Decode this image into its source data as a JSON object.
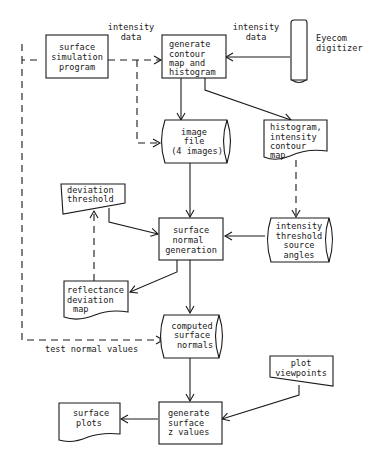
{
  "diagram": {
    "type": "flowchart",
    "nodes": {
      "surface_simulation_program": {
        "shape": "process",
        "lines": [
          "surface",
          "simulation",
          "program"
        ]
      },
      "generate_contour_map": {
        "shape": "process",
        "lines": [
          "generate",
          "contour",
          "map and",
          "histogram"
        ]
      },
      "eyecom_digitizer": {
        "shape": "device",
        "lines": [
          "Eyecom",
          "digitizer"
        ]
      },
      "image_file": {
        "shape": "storage",
        "lines": [
          "image",
          "file",
          "(4 images)"
        ]
      },
      "histogram_contour_map": {
        "shape": "document",
        "lines": [
          "histogram,",
          "intensity",
          "contour",
          "map"
        ]
      },
      "deviation_threshold": {
        "shape": "manual-input",
        "lines": [
          "deviation",
          "threshold"
        ]
      },
      "surface_normal_generation": {
        "shape": "process",
        "lines": [
          "surface",
          "normal",
          "generation"
        ]
      },
      "intensity_threshold_source_angles": {
        "shape": "storage",
        "lines": [
          "intensity",
          "threshold",
          "source",
          "angles"
        ]
      },
      "reflectance_deviation_map": {
        "shape": "document",
        "lines": [
          "reflectance",
          "deviation",
          "map"
        ]
      },
      "computed_surface_normals": {
        "shape": "storage",
        "lines": [
          "computed",
          "surface",
          "normals"
        ]
      },
      "plot_viewpoints": {
        "shape": "manual-input",
        "lines": [
          "plot",
          "viewpoints"
        ]
      },
      "generate_surface_z_values": {
        "shape": "process",
        "lines": [
          "generate",
          "surface",
          "z values"
        ]
      },
      "surface_plots": {
        "shape": "document",
        "lines": [
          "surface",
          "plots"
        ]
      }
    },
    "edge_labels": {
      "sim_intensity": [
        "intensity",
        "data"
      ],
      "eyecom_intensity": [
        "intensity",
        "data"
      ],
      "test_normals": "test normal values"
    },
    "edges": [
      {
        "from": "surface_simulation_program",
        "to": "generate_contour_map",
        "style": "dashed",
        "label": "intensity data"
      },
      {
        "from": "surface_simulation_program",
        "to": "image_file",
        "style": "dashed"
      },
      {
        "from": "surface_simulation_program",
        "to": "computed_surface_normals",
        "style": "dashed",
        "label": "test normal values"
      },
      {
        "from": "eyecom_digitizer",
        "to": "generate_contour_map",
        "style": "solid",
        "label": "intensity data"
      },
      {
        "from": "generate_contour_map",
        "to": "image_file",
        "style": "solid"
      },
      {
        "from": "generate_contour_map",
        "to": "histogram_contour_map",
        "style": "solid"
      },
      {
        "from": "histogram_contour_map",
        "to": "intensity_threshold_source_angles",
        "style": "dashed"
      },
      {
        "from": "image_file",
        "to": "surface_normal_generation",
        "style": "solid"
      },
      {
        "from": "deviation_threshold",
        "to": "surface_normal_generation",
        "style": "solid"
      },
      {
        "from": "intensity_threshold_source_angles",
        "to": "surface_normal_generation",
        "style": "solid"
      },
      {
        "from": "surface_normal_generation",
        "to": "reflectance_deviation_map",
        "style": "solid"
      },
      {
        "from": "reflectance_deviation_map",
        "to": "deviation_threshold",
        "style": "dashed"
      },
      {
        "from": "surface_normal_generation",
        "to": "computed_surface_normals",
        "style": "solid"
      },
      {
        "from": "computed_surface_normals",
        "to": "generate_surface_z_values",
        "style": "solid"
      },
      {
        "from": "plot_viewpoints",
        "to": "generate_surface_z_values",
        "style": "solid"
      },
      {
        "from": "generate_surface_z_values",
        "to": "surface_plots",
        "style": "solid"
      }
    ]
  }
}
